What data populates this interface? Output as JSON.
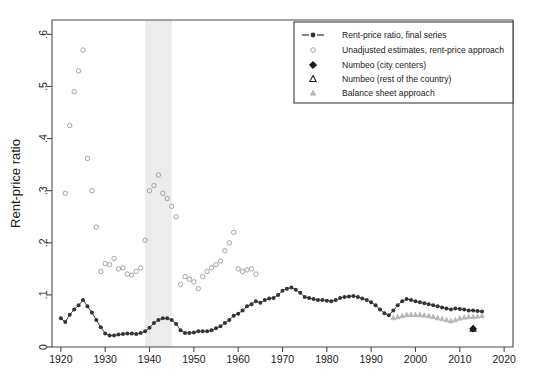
{
  "figure": {
    "background_color": "#ffffff",
    "plot_border_color": "#4a4a4a"
  },
  "axes": {
    "y_title": "Rent-price ratio",
    "y_ticks": [
      "0",
      ".1",
      ".2",
      ".3",
      ".4",
      ".5",
      ".6"
    ],
    "x_ticks": [
      "1920",
      "1930",
      "1940",
      "1950",
      "1960",
      "1970",
      "1980",
      "1990",
      "2000",
      "2010",
      "2020"
    ]
  },
  "legend": {
    "entries": [
      {
        "label": "Rent-price ratio, final series",
        "marker": "line-with-filled-circle",
        "color": "#333333"
      },
      {
        "label": "Unadjusted estimates, rent-price approach",
        "marker": "hollow-circle",
        "color": "#9a9a9a"
      },
      {
        "label": "Numbeo (city centers)",
        "marker": "diamond",
        "color": "#1a1a1a"
      },
      {
        "label": "Numbeo (rest of the country)",
        "marker": "triangle",
        "color": "#1a1a1a"
      },
      {
        "label": "Balance sheet approach",
        "marker": "small-triangle",
        "color": "#b9b9b9"
      }
    ]
  },
  "annotations": {
    "recession_band": {
      "start": 1939,
      "end": 1945,
      "color": "#ececec",
      "label": "shaded-war-period"
    }
  },
  "chart_data": {
    "type": "scatter",
    "title": "",
    "xlabel": "",
    "ylabel": "Rent-price ratio",
    "xlim": [
      1918,
      2022
    ],
    "ylim": [
      0,
      0.62
    ],
    "grid": false,
    "legend_position": "top-right",
    "series": [
      {
        "name": "Rent-price ratio, final series",
        "marker": "filled-circle-connected",
        "color": "#333333",
        "x": [
          1920,
          1921,
          1922,
          1923,
          1924,
          1925,
          1926,
          1927,
          1928,
          1929,
          1930,
          1931,
          1932,
          1933,
          1934,
          1935,
          1936,
          1937,
          1938,
          1939,
          1940,
          1941,
          1942,
          1943,
          1944,
          1945,
          1946,
          1947,
          1948,
          1949,
          1950,
          1951,
          1952,
          1953,
          1954,
          1955,
          1956,
          1957,
          1958,
          1959,
          1960,
          1961,
          1962,
          1963,
          1964,
          1965,
          1966,
          1967,
          1968,
          1969,
          1970,
          1971,
          1972,
          1973,
          1974,
          1975,
          1976,
          1977,
          1978,
          1979,
          1980,
          1981,
          1982,
          1983,
          1984,
          1985,
          1986,
          1987,
          1988,
          1989,
          1990,
          1991,
          1992,
          1993,
          1994,
          1995,
          1996,
          1997,
          1998,
          1999,
          2000,
          2001,
          2002,
          2003,
          2004,
          2005,
          2006,
          2007,
          2008,
          2009,
          2010,
          2011,
          2012,
          2013,
          2014,
          2015
        ],
        "y": [
          0.055,
          0.048,
          0.062,
          0.072,
          0.08,
          0.09,
          0.078,
          0.066,
          0.052,
          0.038,
          0.026,
          0.022,
          0.022,
          0.024,
          0.025,
          0.026,
          0.026,
          0.025,
          0.027,
          0.03,
          0.037,
          0.046,
          0.052,
          0.055,
          0.055,
          0.052,
          0.044,
          0.032,
          0.027,
          0.027,
          0.028,
          0.03,
          0.03,
          0.03,
          0.032,
          0.036,
          0.04,
          0.046,
          0.052,
          0.06,
          0.064,
          0.07,
          0.078,
          0.082,
          0.088,
          0.085,
          0.09,
          0.093,
          0.094,
          0.1,
          0.108,
          0.112,
          0.114,
          0.11,
          0.104,
          0.096,
          0.094,
          0.092,
          0.09,
          0.09,
          0.089,
          0.088,
          0.09,
          0.094,
          0.096,
          0.097,
          0.098,
          0.096,
          0.093,
          0.09,
          0.086,
          0.08,
          0.072,
          0.065,
          0.061,
          0.07,
          0.08,
          0.088,
          0.092,
          0.09,
          0.088,
          0.086,
          0.084,
          0.082,
          0.08,
          0.078,
          0.076,
          0.074,
          0.072,
          0.074,
          0.073,
          0.072,
          0.07,
          0.07,
          0.069,
          0.068
        ]
      },
      {
        "name": "Unadjusted estimates, rent-price approach",
        "marker": "hollow-circle",
        "color": "#9a9a9a",
        "x": [
          1921,
          1922,
          1923,
          1924,
          1925,
          1926,
          1927,
          1928,
          1929,
          1930,
          1931,
          1932,
          1933,
          1934,
          1935,
          1936,
          1937,
          1938,
          1939,
          1940,
          1941,
          1942,
          1943,
          1944,
          1945,
          1946,
          1947,
          1948,
          1949,
          1950,
          1951,
          1952,
          1953,
          1954,
          1955,
          1956,
          1957,
          1958,
          1959,
          1960,
          1961,
          1962,
          1963,
          1964
        ],
        "y": [
          0.295,
          0.425,
          0.49,
          0.53,
          0.57,
          0.362,
          0.3,
          0.23,
          0.145,
          0.16,
          0.158,
          0.17,
          0.15,
          0.152,
          0.14,
          0.138,
          0.145,
          0.152,
          0.205,
          0.3,
          0.31,
          0.33,
          0.295,
          0.285,
          0.27,
          0.25,
          0.12,
          0.135,
          0.13,
          0.125,
          0.112,
          0.135,
          0.145,
          0.152,
          0.158,
          0.165,
          0.185,
          0.2,
          0.22,
          0.15,
          0.145,
          0.148,
          0.15,
          0.14
        ]
      },
      {
        "name": "Balance sheet approach",
        "marker": "small-triangle",
        "color": "#b9b9b9",
        "x": [
          1995,
          1996,
          1997,
          1998,
          1999,
          2000,
          2001,
          2002,
          2003,
          2004,
          2005,
          2006,
          2007,
          2008,
          2009,
          2010,
          2011,
          2012,
          2013,
          2014,
          2015
        ],
        "y": [
          0.056,
          0.058,
          0.06,
          0.062,
          0.062,
          0.062,
          0.062,
          0.061,
          0.06,
          0.058,
          0.056,
          0.054,
          0.052,
          0.05,
          0.052,
          0.055,
          0.057,
          0.058,
          0.058,
          0.059,
          0.06
        ]
      },
      {
        "name": "Numbeo (city centers)",
        "marker": "diamond",
        "color": "#1a1a1a",
        "x": [
          2013
        ],
        "y": [
          0.035
        ]
      },
      {
        "name": "Numbeo (rest of the country)",
        "marker": "triangle",
        "color": "#1a1a1a",
        "x": [
          2013
        ],
        "y": [
          0.035
        ]
      }
    ]
  }
}
